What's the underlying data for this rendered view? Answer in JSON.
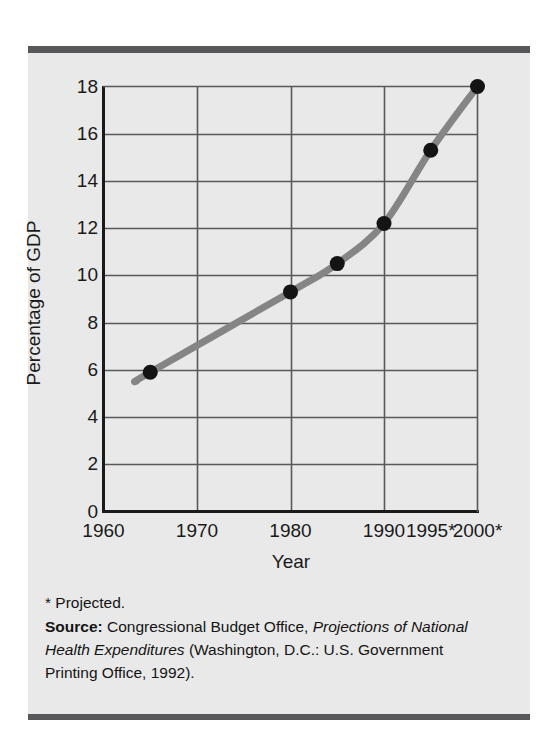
{
  "chart_data": {
    "type": "line",
    "title": "",
    "subtitle": "",
    "xlabel": "Year",
    "ylabel": "Percentage of GDP",
    "xlim": [
      1960,
      2000
    ],
    "ylim": [
      0,
      18
    ],
    "grid": true,
    "legend": "none",
    "series": [
      {
        "name": "National health expenditures as a percentage of GDP",
        "marker": "filled-circle",
        "line_color": "#858585",
        "marker_color": "#141414",
        "x": [
          1965,
          1980,
          1985,
          1990,
          1995,
          2000
        ],
        "values": [
          5.9,
          9.3,
          10.5,
          12.2,
          15.3,
          18.0
        ]
      }
    ],
    "x_ticks": [
      {
        "value": 1960,
        "label": "1960",
        "gridline": true
      },
      {
        "value": 1970,
        "label": "1970",
        "gridline": true
      },
      {
        "value": 1980,
        "label": "1980",
        "gridline": true
      },
      {
        "value": 1990,
        "label": "1990",
        "gridline": true
      },
      {
        "value": 1995,
        "label": "1995*",
        "gridline": false
      },
      {
        "value": 2000,
        "label": "2000*",
        "gridline": true
      }
    ],
    "y_ticks": [
      {
        "value": 18,
        "label": "18"
      },
      {
        "value": 16,
        "label": "16"
      },
      {
        "value": 14,
        "label": "14"
      },
      {
        "value": 12,
        "label": "12"
      },
      {
        "value": 10,
        "label": "10"
      },
      {
        "value": 8,
        "label": "8"
      },
      {
        "value": 6,
        "label": "6"
      },
      {
        "value": 4,
        "label": "4"
      },
      {
        "value": 2,
        "label": "2"
      },
      {
        "value": 0,
        "label": "0"
      }
    ],
    "annotations": [
      "* Projected."
    ]
  },
  "caption": {
    "footnote": "* Projected.",
    "source_label": "Source:",
    "source_text_1": " Congressional Budget Office, ",
    "source_italic": "Projections of National Health Expenditures",
    "source_text_2": " (Washington, D.C.: U.S. Government Printing Office, 1992)."
  },
  "colors": {
    "panel_background": "#e9e9e9",
    "rule": "#58585a",
    "axis": "#1a1a1a",
    "gridline": "#595959",
    "line": "#858585",
    "marker": "#141414",
    "text": "#141414"
  }
}
